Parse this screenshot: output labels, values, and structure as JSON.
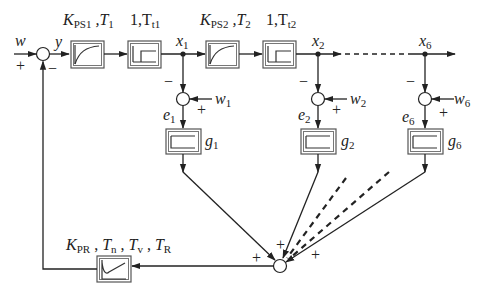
{
  "diagram": {
    "type": "control-loop-block-diagram",
    "input": {
      "label": "w",
      "sign": "+"
    },
    "sum_main": {
      "output_label": "y",
      "feedback_sign": "−"
    },
    "blocks": {
      "ps1": {
        "label_main": "K",
        "label_sub": "PS1",
        "label_rest": " ,T",
        "label_rest_sub": "1",
        "type": "PT1"
      },
      "tt1": {
        "label_main": "1,T",
        "label_sub": "t1",
        "type": "dead-time"
      },
      "ps2": {
        "label_main": "K",
        "label_sub": "PS2",
        "label_rest": " ,T",
        "label_rest_sub": "2",
        "type": "PT1"
      },
      "tt2": {
        "label_main": "1,T",
        "label_sub": "t2",
        "type": "dead-time"
      },
      "controller": {
        "parts": [
          {
            "main": "K",
            "sub": "PR"
          },
          {
            "main": "T",
            "sub": "n"
          },
          {
            "main": "T",
            "sub": "v"
          },
          {
            "main": "T",
            "sub": "R"
          }
        ],
        "separator": " , ",
        "type": "PID"
      }
    },
    "outputs": [
      {
        "id": "x1",
        "main": "x",
        "sub": "1"
      },
      {
        "id": "x2",
        "main": "x",
        "sub": "2"
      },
      {
        "id": "x6",
        "main": "x",
        "sub": "6"
      }
    ],
    "branches": [
      {
        "w_main": "w",
        "w_sub": "1",
        "e_main": "e",
        "e_sub": "1",
        "g_main": "g",
        "g_sub": "1",
        "minus": "−",
        "plus": "+"
      },
      {
        "w_main": "w",
        "w_sub": "2",
        "e_main": "e",
        "e_sub": "2",
        "g_main": "g",
        "g_sub": "2",
        "minus": "−",
        "plus": "+"
      },
      {
        "w_main": "w",
        "w_sub": "6",
        "e_main": "e",
        "e_sub": "6",
        "g_main": "g",
        "g_sub": "6",
        "minus": "−",
        "plus": "+"
      }
    ],
    "sum_bottom": {
      "signs": [
        "+",
        "+",
        "+"
      ]
    }
  }
}
